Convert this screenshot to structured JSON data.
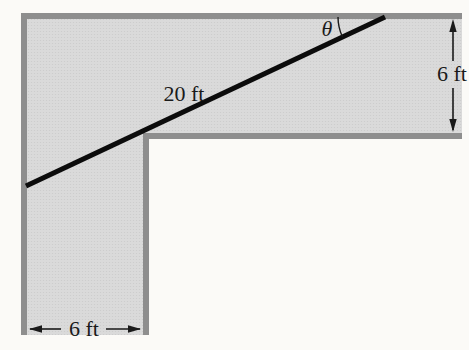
{
  "figure": {
    "labels": {
      "angle": "θ",
      "ladder_length": "20 ft",
      "hallway_width_right": "6 ft",
      "hallway_width_bottom": "6 ft"
    },
    "colors": {
      "hallway_fill": "#dadada",
      "wall": "#8e8e8e",
      "ladder": "#0c0c0c",
      "dimension": "#1a1a1a",
      "background": "#fbfaf7"
    }
  }
}
